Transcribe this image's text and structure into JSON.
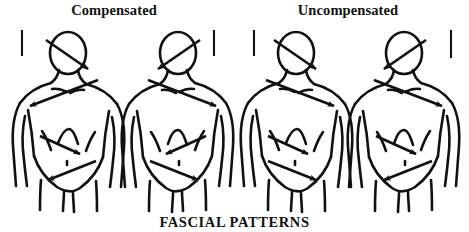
{
  "titles": {
    "left_panel": "Compensated",
    "right_panel": "Uncompensated"
  },
  "caption": "FASCIAL PATTERNS",
  "colors": {
    "ink": "#111111",
    "background": "#ffffff"
  },
  "figures": [
    {
      "id": "figure-1",
      "panel": "Compensated",
      "center_x": 68,
      "arrows": [
        {
          "region": "head",
          "direction": "down-right"
        },
        {
          "region": "shoulder",
          "direction": "down-left"
        },
        {
          "region": "thorax",
          "direction": "down-right"
        },
        {
          "region": "pelvis",
          "direction": "down-left"
        }
      ]
    },
    {
      "id": "figure-2",
      "panel": "Compensated",
      "center_x": 178,
      "arrows": [
        {
          "region": "head",
          "direction": "down-left"
        },
        {
          "region": "shoulder",
          "direction": "down-right"
        },
        {
          "region": "thorax",
          "direction": "down-left"
        },
        {
          "region": "pelvis",
          "direction": "down-right"
        }
      ]
    },
    {
      "id": "figure-3",
      "panel": "Uncompensated",
      "center_x": 296,
      "arrows": [
        {
          "region": "head",
          "direction": "down-right"
        },
        {
          "region": "shoulder",
          "direction": "down-right"
        },
        {
          "region": "thorax",
          "direction": "down-right"
        },
        {
          "region": "pelvis",
          "direction": "down-right"
        }
      ]
    },
    {
      "id": "figure-4",
      "panel": "Uncompensated",
      "center_x": 404,
      "arrows": [
        {
          "region": "head",
          "direction": "down-left"
        },
        {
          "region": "shoulder",
          "direction": "down-right"
        },
        {
          "region": "thorax",
          "direction": "down-right"
        },
        {
          "region": "pelvis",
          "direction": "down-left"
        }
      ]
    }
  ],
  "tick_marks": [
    {
      "id": "tick-1",
      "x": 22,
      "y_top": 30,
      "y_bottom": 56
    },
    {
      "id": "tick-2",
      "x": 214,
      "y_top": 30,
      "y_bottom": 56
    },
    {
      "id": "tick-3",
      "x": 254,
      "y_top": 30,
      "y_bottom": 56
    },
    {
      "id": "tick-4",
      "x": 451,
      "y_top": 30,
      "y_bottom": 58
    }
  ]
}
